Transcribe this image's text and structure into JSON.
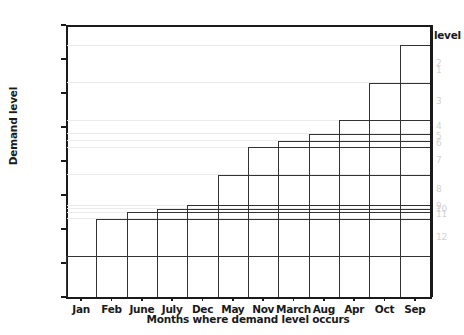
{
  "chart_data": {
    "type": "bar",
    "title": "",
    "xlabel": "Months where demand level occurs",
    "ylabel": "Demand level",
    "ylim": [
      0,
      4000
    ],
    "ytick_values": [
      0,
      500,
      1000,
      1500,
      2000,
      2500,
      3000,
      3500,
      4000
    ],
    "ytick_labels": [
      "0",
      "500",
      "1000",
      "1500",
      "2000",
      "2500",
      "3000",
      "3500",
      "4000"
    ],
    "categories": [
      "Jan",
      "Feb",
      "June",
      "July",
      "Dec",
      "May",
      "Nov",
      "March",
      "Aug",
      "Apr",
      "Oct",
      "Sep"
    ],
    "values": [
      600,
      1150,
      1250,
      1300,
      1350,
      1800,
      2200,
      2300,
      2400,
      2600,
      3150,
      3700
    ],
    "legend_title": "level",
    "legend_labels": [
      "1",
      "2",
      "3",
      "4",
      "5",
      "6",
      "7",
      "8",
      "9",
      "10",
      "11",
      "12"
    ],
    "levels": [
      {
        "level": "1",
        "value": 3700,
        "start_category": "Sep",
        "start_index": 11
      },
      {
        "level": "2",
        "value": 3150,
        "start_category": "Oct",
        "start_index": 10
      },
      {
        "level": "3",
        "value": 2600,
        "start_category": "Apr",
        "start_index": 9
      },
      {
        "level": "4",
        "value": 2400,
        "start_category": "Aug",
        "start_index": 8
      },
      {
        "level": "5",
        "value": 2300,
        "start_category": "March",
        "start_index": 7
      },
      {
        "level": "6",
        "value": 2200,
        "start_category": "Nov",
        "start_index": 6
      },
      {
        "level": "7",
        "value": 1800,
        "start_category": "May",
        "start_index": 5
      },
      {
        "level": "8",
        "value": 1350,
        "start_category": "Dec",
        "start_index": 4
      },
      {
        "level": "9",
        "value": 1300,
        "start_category": "July",
        "start_index": 3
      },
      {
        "level": "10",
        "value": 1250,
        "start_category": "June",
        "start_index": 2
      },
      {
        "level": "11",
        "value": 1150,
        "start_category": "Feb",
        "start_index": 1
      },
      {
        "level": "12",
        "value": 600,
        "start_category": "Jan",
        "start_index": 0
      }
    ],
    "grid": true,
    "legend_position": "right",
    "colors": {
      "axis": "#1a1a1a",
      "step_line": "#333333",
      "gridline": "#eceaea",
      "legend_text": "#d2d2d2",
      "background": "#ffffff"
    }
  }
}
